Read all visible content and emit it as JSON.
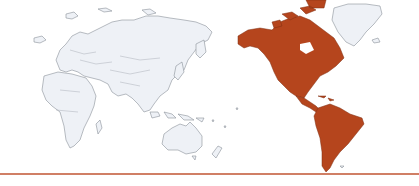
{
  "map": {
    "projection": "pacific-centered world map",
    "highlighted_region": "Americas",
    "colors": {
      "highlight": "#b5451d",
      "land": "#eef1f6",
      "outline": "#8a9099",
      "background": "#ffffff",
      "divider": "#c8694a"
    },
    "regions": [
      {
        "name": "Europe",
        "highlighted": false
      },
      {
        "name": "Asia",
        "highlighted": false
      },
      {
        "name": "Africa",
        "highlighted": false
      },
      {
        "name": "Oceania",
        "highlighted": false
      },
      {
        "name": "North America",
        "highlighted": true
      },
      {
        "name": "Central America",
        "highlighted": true
      },
      {
        "name": "South America",
        "highlighted": true
      },
      {
        "name": "Greenland",
        "highlighted": false
      }
    ]
  }
}
